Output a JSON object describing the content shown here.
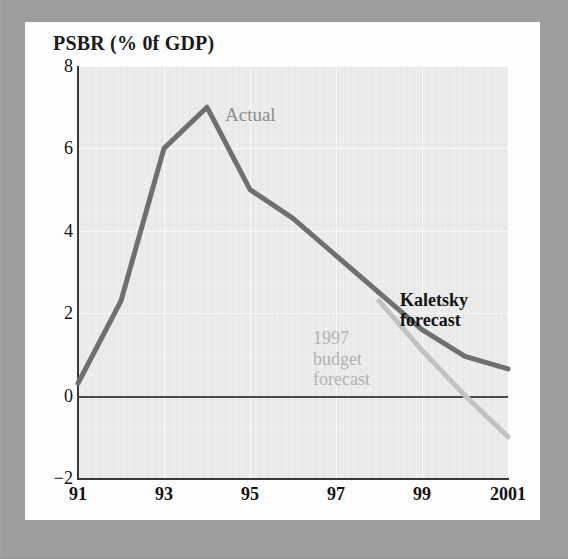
{
  "chart_data": {
    "type": "line",
    "title": "PSBR (% 0f GDP)",
    "xlabel": "",
    "ylabel": "PSBR (% 0f GDP)",
    "xlim": [
      1991,
      2001
    ],
    "ylim": [
      -2,
      8
    ],
    "yticks": [
      8,
      6,
      4,
      2,
      0,
      -2
    ],
    "ytick_labels": [
      "8",
      "6",
      "4",
      "2",
      "0",
      "−2"
    ],
    "xticks": [
      1991,
      1993,
      1995,
      1997,
      1999,
      2001
    ],
    "xtick_labels": [
      "91",
      "93",
      "95",
      "97",
      "99",
      "2001"
    ],
    "grid": true,
    "legend": "none",
    "zero_line": true,
    "series": [
      {
        "name": "Actual",
        "color": "#6f6f6f",
        "style": "solid",
        "x": [
          1991,
          1992,
          1993,
          1994,
          1995,
          1996,
          1997,
          1998
        ],
        "values": [
          0.3,
          2.3,
          6.0,
          7.0,
          5.0,
          4.3,
          3.4,
          2.5
        ]
      },
      {
        "name": "Kaletsky forecast",
        "color": "#6f6f6f",
        "style": "solid",
        "x": [
          1998,
          1999,
          2000,
          2001
        ],
        "values": [
          2.5,
          1.6,
          0.95,
          0.65
        ]
      },
      {
        "name": "1997 budget forecast",
        "color": "#c2c2c2",
        "style": "solid",
        "x": [
          1998,
          1999,
          2000,
          2001
        ],
        "values": [
          2.3,
          1.1,
          0.0,
          -1.0
        ]
      }
    ],
    "annotations": [
      {
        "id": "actual",
        "text": "Actual",
        "color": "#8d8d8d"
      },
      {
        "id": "kaletsky",
        "text": "Kaletsky\nforecast",
        "color": "#121212"
      },
      {
        "id": "budget",
        "text": "1997\nbudget\nforecast",
        "color": "#b2b2b2"
      }
    ]
  },
  "colors": {
    "mat": "#9d9d9d",
    "card": "#fdfdfd",
    "plot_background": "#ececec",
    "axis": "#3a3a3a",
    "gridline": "#ffffff",
    "actual_line": "#6f6f6f",
    "budget_line": "#c2c2c2"
  }
}
